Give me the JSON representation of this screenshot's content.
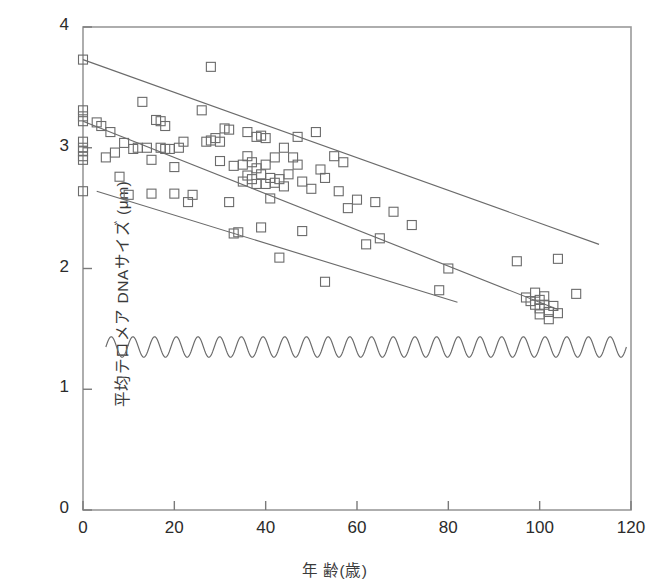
{
  "chart_data": {
    "type": "scatter",
    "title": "",
    "xlabel": "年 齢(歳)",
    "ylabel": "平均テロメア DNAサイズ (μm)",
    "xlim": [
      0,
      120
    ],
    "ylim": [
      0,
      4
    ],
    "xticks": [
      0,
      20,
      40,
      60,
      80,
      100,
      120
    ],
    "yticks": [
      0,
      1,
      2,
      3,
      4
    ],
    "grid": false,
    "legend": "none",
    "marker": "open-square",
    "marker_color": "#6b6b6b",
    "line_color": "#6b6b6b",
    "points": [
      [
        0,
        3.73
      ],
      [
        0,
        3.31
      ],
      [
        0,
        3.26
      ],
      [
        0,
        3.22
      ],
      [
        0,
        3.05
      ],
      [
        0,
        3.0
      ],
      [
        0,
        2.97
      ],
      [
        0,
        2.93
      ],
      [
        0,
        2.9
      ],
      [
        0,
        2.64
      ],
      [
        3,
        3.21
      ],
      [
        4,
        3.18
      ],
      [
        5,
        2.92
      ],
      [
        6,
        3.13
      ],
      [
        7,
        2.96
      ],
      [
        8,
        2.76
      ],
      [
        9,
        3.04
      ],
      [
        10,
        2.61
      ],
      [
        11,
        2.99
      ],
      [
        12,
        3.0
      ],
      [
        13,
        3.38
      ],
      [
        14,
        3.0
      ],
      [
        15,
        2.9
      ],
      [
        15,
        2.62
      ],
      [
        16,
        3.23
      ],
      [
        17,
        3.22
      ],
      [
        17,
        3.0
      ],
      [
        18,
        3.18
      ],
      [
        18,
        2.99
      ],
      [
        19,
        2.99
      ],
      [
        20,
        2.84
      ],
      [
        20,
        2.62
      ],
      [
        21,
        3.0
      ],
      [
        22,
        3.05
      ],
      [
        23,
        2.55
      ],
      [
        24,
        2.61
      ],
      [
        26,
        3.31
      ],
      [
        27,
        3.05
      ],
      [
        28,
        3.67
      ],
      [
        28,
        3.06
      ],
      [
        29,
        3.08
      ],
      [
        30,
        3.05
      ],
      [
        30,
        2.89
      ],
      [
        31,
        3.16
      ],
      [
        32,
        3.15
      ],
      [
        32,
        2.55
      ],
      [
        33,
        2.85
      ],
      [
        33,
        2.29
      ],
      [
        34,
        2.3
      ],
      [
        35,
        2.86
      ],
      [
        35,
        2.72
      ],
      [
        36,
        3.13
      ],
      [
        36,
        2.93
      ],
      [
        36,
        2.77
      ],
      [
        37,
        2.88
      ],
      [
        37,
        2.74
      ],
      [
        38,
        3.09
      ],
      [
        38,
        2.83
      ],
      [
        38,
        2.7
      ],
      [
        39,
        3.1
      ],
      [
        39,
        2.78
      ],
      [
        39,
        2.34
      ],
      [
        40,
        3.08
      ],
      [
        40,
        2.86
      ],
      [
        40,
        2.7
      ],
      [
        41,
        2.75
      ],
      [
        41,
        2.58
      ],
      [
        42,
        2.92
      ],
      [
        42,
        2.71
      ],
      [
        43,
        2.74
      ],
      [
        43,
        2.09
      ],
      [
        44,
        3.0
      ],
      [
        44,
        2.68
      ],
      [
        45,
        2.78
      ],
      [
        46,
        2.92
      ],
      [
        47,
        3.09
      ],
      [
        47,
        2.86
      ],
      [
        48,
        2.72
      ],
      [
        48,
        2.31
      ],
      [
        50,
        2.66
      ],
      [
        51,
        3.13
      ],
      [
        52,
        2.82
      ],
      [
        53,
        2.75
      ],
      [
        53,
        1.89
      ],
      [
        55,
        2.93
      ],
      [
        56,
        2.64
      ],
      [
        57,
        2.88
      ],
      [
        58,
        2.5
      ],
      [
        60,
        2.57
      ],
      [
        62,
        2.2
      ],
      [
        64,
        2.55
      ],
      [
        65,
        2.25
      ],
      [
        68,
        2.47
      ],
      [
        72,
        2.36
      ],
      [
        78,
        1.82
      ],
      [
        80,
        2.0
      ],
      [
        95,
        2.06
      ],
      [
        97,
        1.76
      ],
      [
        98,
        1.73
      ],
      [
        99,
        1.7
      ],
      [
        99,
        1.8
      ],
      [
        100,
        1.67
      ],
      [
        100,
        1.74
      ],
      [
        100,
        1.62
      ],
      [
        101,
        1.7
      ],
      [
        101,
        1.77
      ],
      [
        102,
        1.64
      ],
      [
        102,
        1.58
      ],
      [
        103,
        1.69
      ],
      [
        104,
        2.08
      ],
      [
        104,
        1.63
      ],
      [
        108,
        1.79
      ]
    ],
    "regression_lines": [
      {
        "name": "upper-bound-line",
        "x": [
          0,
          113
        ],
        "y": [
          3.73,
          2.2
        ]
      },
      {
        "name": "mean-regression-line",
        "x": [
          0,
          104
        ],
        "y": [
          3.22,
          1.66
        ]
      },
      {
        "name": "lower-bound-line",
        "x": [
          3,
          82
        ],
        "y": [
          2.64,
          1.72
        ]
      }
    ],
    "wave_marker": {
      "name": "sinusoidal-break-line",
      "y": 1.35,
      "x_start": 5,
      "x_end": 119,
      "cycles": 24,
      "amplitude": 0.085
    }
  },
  "axes": {
    "x_tick_labels": [
      "0",
      "20",
      "40",
      "60",
      "80",
      "100",
      "120"
    ],
    "y_tick_labels": [
      "0",
      "1",
      "2",
      "3",
      "4"
    ],
    "x_axis_title": "年 齢(歳)",
    "y_axis_title": "平均テロメア DNAサイズ (μm)"
  }
}
